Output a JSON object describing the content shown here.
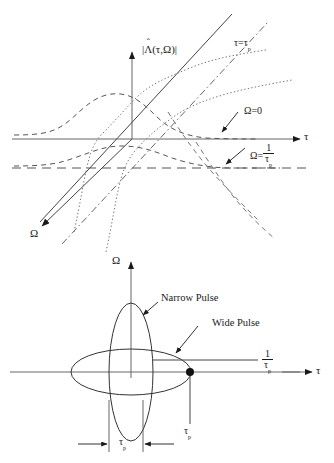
{
  "figure": {
    "type": "technical-diagram"
  },
  "top_plot": {
    "name": "ambiguity-function-cuts",
    "vertical_axis_label": {
      "open_bar": "|",
      "lambda": "Λ",
      "hat": "ˆ",
      "args": "(τ,Ω)",
      "close_bar": "|"
    },
    "tau_axis_label": "τ",
    "omega_axis_label": "Ω",
    "annotations": [
      {
        "id": "tau-equals-taup",
        "text_main": "τ=τ",
        "text_sub": "p"
      },
      {
        "id": "omega-zero",
        "text": "Ω=0"
      },
      {
        "id": "omega-one-over-taup",
        "prefix": "Ω=",
        "numerator": "1",
        "denominator_main": "τ",
        "denominator_sub": "p"
      }
    ]
  },
  "bottom_plot": {
    "name": "ambiguity-ellipses",
    "vertical_axis_label": "Ω",
    "tau_axis_label": "τ",
    "annotations": [
      {
        "id": "narrow-pulse",
        "text": "Narrow Pulse"
      },
      {
        "id": "wide-pulse",
        "text": "Wide Pulse"
      },
      {
        "id": "one-over-taup",
        "numerator": "1",
        "denominator_main": "τ",
        "denominator_sub": "p"
      },
      {
        "id": "taup-point",
        "text_main": "τ",
        "text_sub": "p"
      },
      {
        "id": "taup-width",
        "text_main": "τ",
        "text_sub": "p"
      }
    ]
  },
  "colors": {
    "stroke": "#1a1a1a",
    "axis": "#555555",
    "background": "#ffffff"
  }
}
